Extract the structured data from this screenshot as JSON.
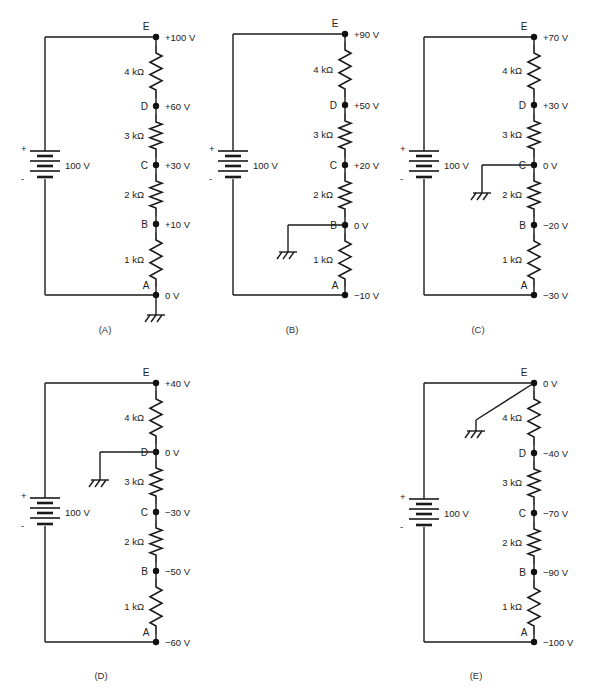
{
  "figure": {
    "battery_label": "100 V",
    "battery_plus": "+",
    "battery_minus": "-",
    "resistors": [
      "4 kΩ",
      "3 kΩ",
      "2 kΩ",
      "1 kΩ"
    ],
    "panels": [
      {
        "id": "A",
        "caption": "(A)",
        "ground_node": "A",
        "nodes": [
          {
            "name": "E",
            "voltage": "+100 V"
          },
          {
            "name": "D",
            "voltage": "+60 V"
          },
          {
            "name": "C",
            "voltage": "+30 V"
          },
          {
            "name": "B",
            "voltage": "+10 V"
          },
          {
            "name": "A",
            "voltage": "0 V"
          }
        ]
      },
      {
        "id": "B",
        "caption": "(B)",
        "ground_node": "B",
        "nodes": [
          {
            "name": "E",
            "voltage": "+90 V"
          },
          {
            "name": "D",
            "voltage": "+50 V"
          },
          {
            "name": "C",
            "voltage": "+20 V"
          },
          {
            "name": "B",
            "voltage": "0 V"
          },
          {
            "name": "A",
            "voltage": "−10 V"
          }
        ]
      },
      {
        "id": "C",
        "caption": "(C)",
        "ground_node": "C",
        "nodes": [
          {
            "name": "E",
            "voltage": "+70 V"
          },
          {
            "name": "D",
            "voltage": "+30 V"
          },
          {
            "name": "C",
            "voltage": "0 V"
          },
          {
            "name": "B",
            "voltage": "−20 V"
          },
          {
            "name": "A",
            "voltage": "−30 V"
          }
        ]
      },
      {
        "id": "D",
        "caption": "(D)",
        "ground_node": "D",
        "nodes": [
          {
            "name": "E",
            "voltage": "+40 V"
          },
          {
            "name": "D",
            "voltage": "0 V"
          },
          {
            "name": "C",
            "voltage": "−30 V"
          },
          {
            "name": "B",
            "voltage": "−50 V"
          },
          {
            "name": "A",
            "voltage": "−60 V"
          }
        ]
      },
      {
        "id": "E",
        "caption": "(E)",
        "ground_node": "E",
        "nodes": [
          {
            "name": "E",
            "voltage": "0 V"
          },
          {
            "name": "D",
            "voltage": "−40 V"
          },
          {
            "name": "C",
            "voltage": "−70 V"
          },
          {
            "name": "B",
            "voltage": "−90 V"
          },
          {
            "name": "A",
            "voltage": "−100 V"
          }
        ]
      }
    ]
  },
  "colors": {
    "ink": "#1a1a1a",
    "background": "#ffffff"
  }
}
